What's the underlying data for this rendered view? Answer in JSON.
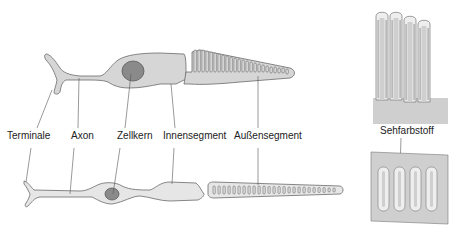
{
  "diagram": {
    "labels": {
      "terminale": "Terminale",
      "axon": "Axon",
      "zellkern": "Zellkern",
      "innensegment": "Innensegment",
      "aussensegment": "Außensegment",
      "sehfarbstoff": "Sehfarbstoff"
    },
    "colors": {
      "cell_fill": "#d6d6d6",
      "cell_stroke": "#6a6a6a",
      "nucleus_fill": "#8a8a8a",
      "rod_fill": "#e6e6e6",
      "leader_line": "#555555",
      "panel_fill": "#cfcfcf"
    },
    "cells": [
      {
        "name": "cone",
        "position": "top"
      },
      {
        "name": "rod",
        "position": "bottom"
      }
    ],
    "insets": [
      {
        "name": "cone-outer-segment-detail",
        "position": "top-right"
      },
      {
        "name": "rod-outer-segment-detail",
        "position": "bottom-right"
      }
    ]
  }
}
